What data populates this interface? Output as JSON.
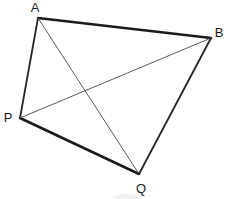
{
  "figure": {
    "background_color": "#ffffff",
    "stroke_color": "#1a1a1a",
    "width": 229,
    "height": 199,
    "vertices": [
      {
        "id": "A",
        "label": "A",
        "x": 38,
        "y": 18,
        "label_x": 35,
        "label_y": 7
      },
      {
        "id": "B",
        "label": "B",
        "x": 211,
        "y": 38,
        "label_x": 219,
        "label_y": 32
      },
      {
        "id": "P",
        "label": "P",
        "x": 20,
        "y": 118,
        "label_x": 8,
        "label_y": 117
      },
      {
        "id": "Q",
        "label": "Q",
        "x": 139,
        "y": 174,
        "label_x": 141,
        "label_y": 188
      }
    ],
    "edges": [
      {
        "id": "AB",
        "from": "A",
        "to": "B",
        "weight": "thick",
        "role": "side"
      },
      {
        "id": "BQ",
        "from": "B",
        "to": "Q",
        "weight": "medium",
        "role": "side"
      },
      {
        "id": "QP",
        "from": "Q",
        "to": "P",
        "weight": "thick",
        "role": "side"
      },
      {
        "id": "PA",
        "from": "P",
        "to": "A",
        "weight": "medium",
        "role": "side"
      },
      {
        "id": "AQ",
        "from": "A",
        "to": "Q",
        "weight": "thin",
        "role": "diagonal"
      },
      {
        "id": "PB",
        "from": "P",
        "to": "B",
        "weight": "thin",
        "role": "diagonal"
      }
    ],
    "diagonal_intersection": {
      "x": 85,
      "y": 95
    },
    "artifact": {
      "x": 114,
      "y": 194,
      "width": 26,
      "height": 6
    }
  }
}
